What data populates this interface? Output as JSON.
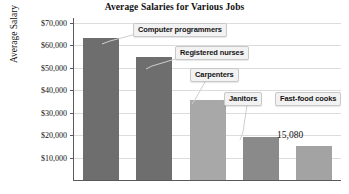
{
  "chart_data": {
    "type": "bar",
    "title": "Average Salaries for Various Jobs",
    "xlabel": "",
    "ylabel": "Average Salary",
    "categories": [
      "Computer programmers",
      "Registered nurses",
      "Carpenters",
      "Janitors",
      "Fast-food cooks"
    ],
    "values": [
      63000,
      54500,
      35500,
      19000,
      15080
    ],
    "ylim": [
      0,
      72000
    ],
    "ytick_values": [
      10000,
      20000,
      30000,
      40000,
      50000,
      60000,
      70000
    ],
    "ytick_labels": [
      "$10,000",
      "$20,000",
      "$30,000",
      "$40,000",
      "$50,000",
      "$60,000",
      "$70,000"
    ],
    "grid": true,
    "legend": "none",
    "bar_colors": [
      "#6e6e6e",
      "#6e6e6e",
      "#a8a8a8",
      "#8a8a8a",
      "#a3a3a3"
    ],
    "annotations": [
      {
        "name": "computer-programmers",
        "text": "Computer programmers",
        "style": "callout"
      },
      {
        "name": "registered-nurses",
        "text": "Registered nurses",
        "style": "callout"
      },
      {
        "name": "carpenters",
        "text": "Carpenters",
        "style": "callout"
      },
      {
        "name": "janitors",
        "text": "Janitors",
        "style": "callout"
      },
      {
        "name": "fast-food-cooks",
        "text": "Fast-food cooks",
        "style": "callout"
      },
      {
        "name": "fast-food-cooks-value",
        "text": "15,080",
        "style": "data-label"
      }
    ]
  },
  "axis": {
    "ticks": [
      {
        "label": "$70,000"
      },
      {
        "label": "$60,000"
      },
      {
        "label": "$50,000"
      },
      {
        "label": "$40,000"
      },
      {
        "label": "$30,000"
      },
      {
        "label": "$20,000"
      },
      {
        "label": "$10,000"
      }
    ]
  },
  "callouts": {
    "programmers": "Computer programmers",
    "nurses": "Registered nurses",
    "carpenters": "Carpenters",
    "janitors": "Janitors",
    "cooks": "Fast-food cooks",
    "cooks_value": "15,080"
  }
}
